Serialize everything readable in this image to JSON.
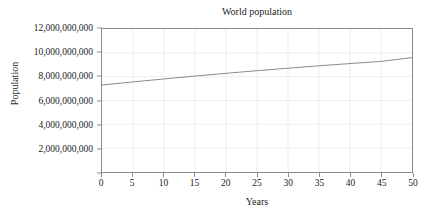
{
  "chart_data": {
    "type": "line",
    "title": "World population",
    "xlabel": "Years",
    "ylabel": "Population",
    "xlim": [
      0,
      50
    ],
    "ylim": [
      0,
      12000000000
    ],
    "grid": true,
    "legend": null,
    "xticks": [
      0,
      5,
      10,
      15,
      20,
      25,
      30,
      35,
      40,
      45,
      50
    ],
    "xtick_labels": [
      "0",
      "5",
      "10",
      "15",
      "20",
      "25",
      "30",
      "35",
      "40",
      "45",
      "50"
    ],
    "yticks": [
      2000000000,
      4000000000,
      6000000000,
      8000000000,
      10000000000,
      12000000000
    ],
    "ytick_labels": [
      "2,000,000,000",
      "4,000,000,000",
      "6,000,000,000",
      "8,000,000,000",
      "10,000,000,000",
      "12,000,000,000"
    ],
    "series": [
      {
        "name": "World population",
        "color": "#8a8a8a",
        "line_width": 1,
        "x": [
          0,
          5,
          10,
          15,
          20,
          25,
          30,
          35,
          40,
          45,
          50
        ],
        "values": [
          7300000000,
          7560000000,
          7810000000,
          8050000000,
          8280000000,
          8500000000,
          8710000000,
          8910000000,
          9100000000,
          9280000000,
          9600000000
        ]
      }
    ]
  },
  "figure": {
    "background_color": "#ffffff",
    "axis_color": "#8b8b8b",
    "grid_color": "#ededed",
    "text_color": "#232323"
  }
}
